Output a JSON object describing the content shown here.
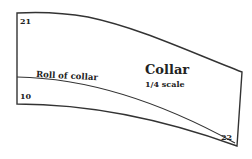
{
  "diagram": {
    "title": "Collar",
    "scale": "1/4 scale",
    "roll_label": "Roll of collar",
    "points": {
      "top_left": "21",
      "bottom_left": "10",
      "bottom_right": "22"
    },
    "line_color": "#333333",
    "background": "#ffffff"
  }
}
